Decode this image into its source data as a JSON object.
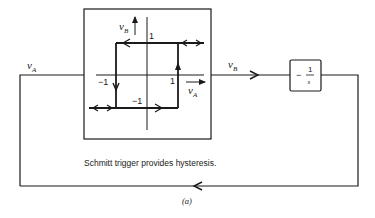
{
  "diagram": {
    "type": "block-diagram",
    "figure_label": "(a)",
    "caption": "Schmitt trigger provides hysteresis.",
    "signals": {
      "input": {
        "symbol": "v",
        "subscript": "A"
      },
      "output": {
        "symbol": "v",
        "subscript": "B"
      }
    },
    "schmitt_trigger": {
      "name": "Schmitt trigger",
      "plot": {
        "x_axis": {
          "symbol": "v",
          "subscript": "A"
        },
        "y_axis": {
          "symbol": "v",
          "subscript": "B"
        },
        "labels": {
          "y_high": "1",
          "y_low": "−1",
          "x_high": "1",
          "x_low": "−1"
        },
        "hysteresis_loop": {
          "thresholds": [
            -1,
            1
          ],
          "levels": [
            -1,
            1
          ],
          "path": "upper level traversed leftward until vA=-1, drop to -1; lower level traversed rightward until vA=1, rise to +1"
        }
      }
    },
    "integrator": {
      "name": "integrator",
      "transfer_function": {
        "sign": "−",
        "numerator": "1",
        "denominator": "s"
      }
    },
    "feedback": {
      "description": "output of integrator fed back to vA"
    },
    "colors": {
      "line": "#1a1a1a",
      "background": "#ffffff"
    }
  }
}
